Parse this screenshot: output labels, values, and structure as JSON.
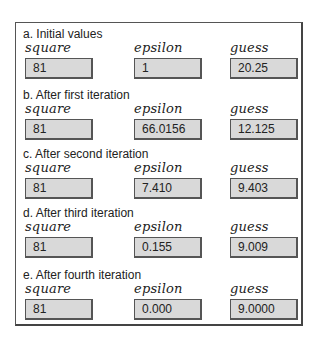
{
  "columns": [
    "square",
    "epsilon",
    "guess"
  ],
  "sections": [
    {
      "heading": "a. Initial values",
      "square": "81",
      "epsilon": "1",
      "guess": "20.25"
    },
    {
      "heading": "b. After first iteration",
      "square": "81",
      "epsilon": "66.0156",
      "guess": "12.125"
    },
    {
      "heading": "c. After second iteration",
      "square": "81",
      "epsilon": "7.410",
      "guess": "9.403"
    },
    {
      "heading": "d. After third iteration",
      "square": "81",
      "epsilon": "0.155",
      "guess": "9.009"
    },
    {
      "heading": "e. After fourth iteration",
      "square": "81",
      "epsilon": "0.000",
      "guess": "9.0000"
    }
  ]
}
